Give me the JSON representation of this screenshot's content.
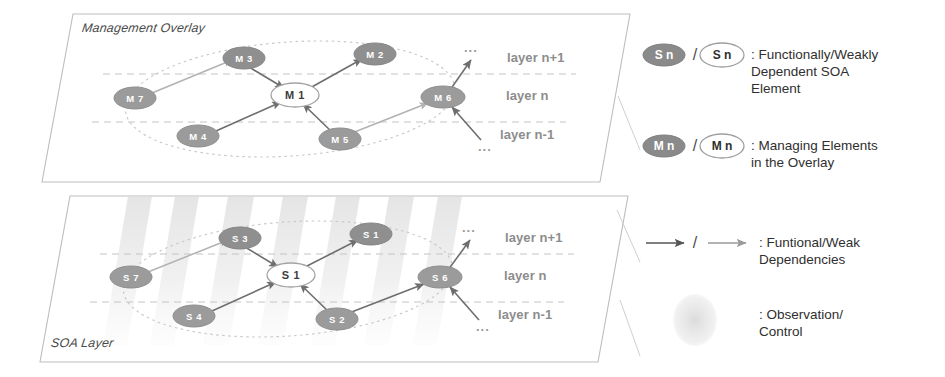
{
  "figure": {
    "panels": [
      {
        "id": "management-overlay",
        "title": "Management Overlay",
        "layer_labels": [
          "layer n+1",
          "layer n",
          "layer n-1"
        ],
        "ellipsis_marks": [
          "...",
          "..."
        ],
        "nodes": [
          {
            "id": "M7",
            "label": "M 7",
            "style": "filled"
          },
          {
            "id": "M3",
            "label": "M 3",
            "style": "filled"
          },
          {
            "id": "M2",
            "label": "M 2",
            "style": "filled"
          },
          {
            "id": "M1",
            "label": "M 1",
            "style": "hollow"
          },
          {
            "id": "M4",
            "label": "M 4",
            "style": "filled"
          },
          {
            "id": "M5",
            "label": "M 5",
            "style": "filled"
          },
          {
            "id": "M6",
            "label": "M 6",
            "style": "filled"
          }
        ],
        "edges": [
          {
            "from": "M7",
            "to": "M3",
            "kind": "weak"
          },
          {
            "from": "M3",
            "to": "M1",
            "kind": "functional"
          },
          {
            "from": "M1",
            "to": "M2",
            "kind": "functional"
          },
          {
            "from": "M4",
            "to": "M1",
            "kind": "functional"
          },
          {
            "from": "M5",
            "to": "M1",
            "kind": "functional"
          },
          {
            "from": "M5",
            "to": "M6",
            "kind": "weak"
          },
          {
            "from": "M6",
            "to": "up",
            "kind": "functional"
          },
          {
            "from": "down",
            "to": "M6",
            "kind": "functional"
          }
        ]
      },
      {
        "id": "soa-layer",
        "title": "SOA Layer",
        "layer_labels": [
          "layer n+1",
          "layer n",
          "layer n-1"
        ],
        "ellipsis_marks": [
          "...",
          "..."
        ],
        "nodes": [
          {
            "id": "S7",
            "label": "S 7",
            "style": "filled"
          },
          {
            "id": "S3",
            "label": "S 3",
            "style": "filled"
          },
          {
            "id": "S1b",
            "label": "S 1",
            "style": "filled"
          },
          {
            "id": "S1",
            "label": "S 1",
            "style": "hollow"
          },
          {
            "id": "S4",
            "label": "S 4",
            "style": "filled"
          },
          {
            "id": "S2",
            "label": "S 2",
            "style": "filled"
          },
          {
            "id": "S6",
            "label": "S 6",
            "style": "filled"
          }
        ],
        "edges": [
          {
            "from": "S7",
            "to": "S3",
            "kind": "weak"
          },
          {
            "from": "S3",
            "to": "S1",
            "kind": "functional"
          },
          {
            "from": "S1",
            "to": "S1b",
            "kind": "functional"
          },
          {
            "from": "S4",
            "to": "S1",
            "kind": "functional"
          },
          {
            "from": "S2",
            "to": "S1",
            "kind": "functional"
          },
          {
            "from": "S2",
            "to": "S6",
            "kind": "weak"
          },
          {
            "from": "S6",
            "to": "up",
            "kind": "functional"
          },
          {
            "from": "down",
            "to": "S6",
            "kind": "functional"
          }
        ]
      }
    ]
  },
  "legend": {
    "items": [
      {
        "id": "soa-element",
        "symbol_filled": "S n",
        "symbol_hollow": "S n",
        "separator": "/",
        "description": ": Functionally/Weakly\nDependent SOA\nElement"
      },
      {
        "id": "managing-element",
        "symbol_filled": "M n",
        "symbol_hollow": "M n",
        "separator": "/",
        "description": ": Managing Elements\nin the Overlay"
      },
      {
        "id": "dependencies",
        "symbol_filled": "",
        "symbol_hollow": "",
        "separator": "/",
        "description": ": Funtional/Weak\nDependencies"
      },
      {
        "id": "observation-control",
        "symbol_filled": "",
        "symbol_hollow": "",
        "separator": "",
        "description": ": Observation/\nControl"
      }
    ]
  },
  "colors": {
    "node_fill": "#9b9b9b",
    "node_fill_dark": "#8a8a8a",
    "node_stroke": "#7a7a7a",
    "hollow_fill": "#ffffff",
    "hollow_stroke": "#9e9e9e",
    "panel_stroke": "#b9b9b9",
    "layer_dash": "#bdbdbd",
    "arrow_functional": "#6e6e6e",
    "arrow_weak": "#b0b0b0",
    "ellipse_dotted": "#c2c2c2",
    "band": "#e2e2e2",
    "text": "#2f2f2f",
    "layer_label": "#8d8d8d"
  }
}
